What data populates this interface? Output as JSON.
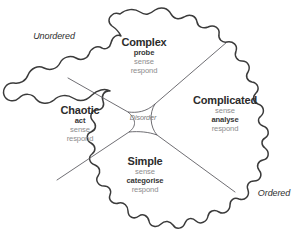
{
  "diagram": {
    "name": "Cynefin framework",
    "axes": {
      "unordered": "Unordered",
      "ordered": "Ordered"
    },
    "center": {
      "label": "Disorder"
    },
    "domains": [
      {
        "id": "complex",
        "title": "Complex",
        "actions": [
          "probe",
          "sense",
          "respond"
        ],
        "primary_action": "probe"
      },
      {
        "id": "complicated",
        "title": "Complicated",
        "actions": [
          "sense",
          "analyse",
          "respond"
        ],
        "primary_action": "analyse"
      },
      {
        "id": "chaotic",
        "title": "Chaotic",
        "actions": [
          "act",
          "sense",
          "respond"
        ],
        "primary_action": "act"
      },
      {
        "id": "simple",
        "title": "Simple",
        "actions": [
          "sense",
          "categorise",
          "respond"
        ],
        "primary_action": "categorise"
      }
    ],
    "colors": {
      "outline": "#3b3b3b",
      "divider": "#55545a",
      "title_text": "#2c2c2c",
      "muted_text": "#8d8d8d",
      "bold_action_text": "#363636",
      "background": "#ffffff"
    }
  }
}
